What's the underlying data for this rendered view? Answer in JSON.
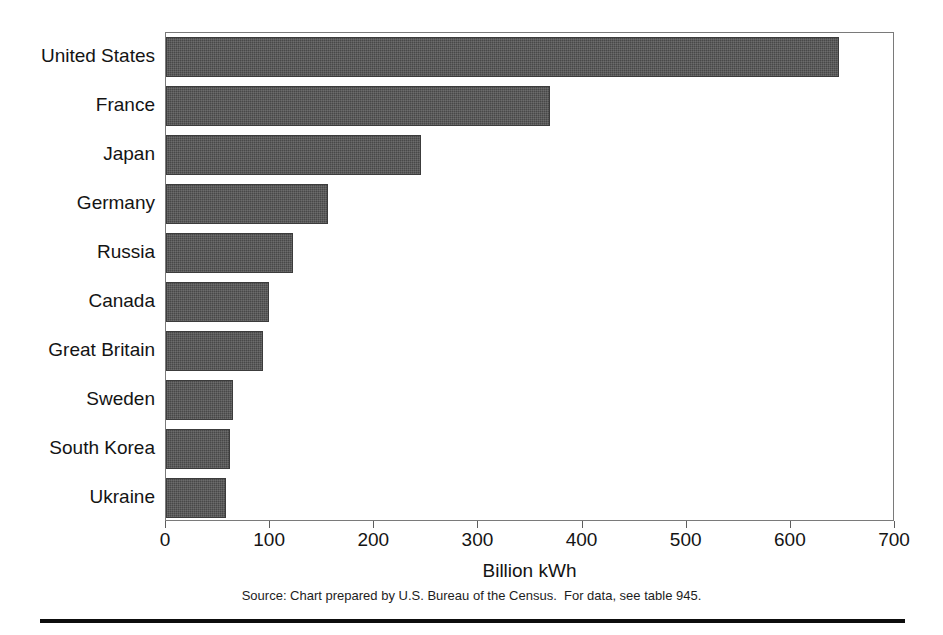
{
  "chart_data": {
    "type": "bar",
    "orientation": "horizontal",
    "title": "",
    "xlabel": "Billion kWh",
    "ylabel": "",
    "xlim": [
      0,
      700
    ],
    "xticks": [
      0,
      100,
      200,
      300,
      400,
      500,
      600,
      700
    ],
    "grid": false,
    "legend": null,
    "categories": [
      "United States",
      "France",
      "Japan",
      "Germany",
      "Russia",
      "Canada",
      "Great Britain",
      "Sweden",
      "South Korea",
      "Ukraine"
    ],
    "values": [
      646,
      369,
      245,
      156,
      122,
      99,
      93,
      64,
      61,
      58
    ],
    "bar_color": "#484848",
    "source_note": "Source: Chart prepared by U.S. Bureau of the Census.  For data, see table 945."
  },
  "axis": {
    "x_title": "Billion kWh",
    "tick_labels": [
      "0",
      "100",
      "200",
      "300",
      "400",
      "500",
      "600",
      "700"
    ]
  },
  "footer": {
    "source": "Source: Chart prepared by U.S. Bureau of the Census.  For data, see table 945."
  }
}
